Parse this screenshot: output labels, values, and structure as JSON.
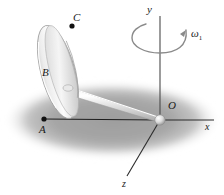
{
  "figure": {
    "type": "mechanics-diagram",
    "canvas": {
      "width": 224,
      "height": 195,
      "background": "#ffffff"
    }
  },
  "labels": {
    "point_a": "A",
    "point_b": "B",
    "point_c": "C",
    "origin": "O",
    "axis_x": "x",
    "axis_y": "y",
    "axis_z": "z",
    "omega": "ω",
    "omega_subscript": "1"
  },
  "colors": {
    "background": "#ffffff",
    "shadow": "#a9a9a9",
    "ink": "#1a1a1a",
    "axis": "#555555",
    "disk_light": "#ffffff",
    "disk_mid": "#d8d8d8",
    "disk_dark": "#b4b4b4",
    "rod_light": "#ffffff",
    "rod_dark": "#bdbdbd",
    "arc": "#8a8a8a"
  },
  "geometry": {
    "origin": {
      "x": 160,
      "y": 120
    },
    "point_a": {
      "x": 44,
      "y": 119
    },
    "point_c": {
      "x": 72,
      "y": 26
    },
    "disk_center": {
      "x": 58,
      "y": 72
    },
    "axis_y_top": {
      "x": 160,
      "y": 16
    },
    "axis_x_right": {
      "x": 214,
      "y": 120
    },
    "axis_z_end": {
      "x": 127,
      "y": 176
    },
    "rotation_arc_center": {
      "x": 160,
      "y": 36
    }
  }
}
